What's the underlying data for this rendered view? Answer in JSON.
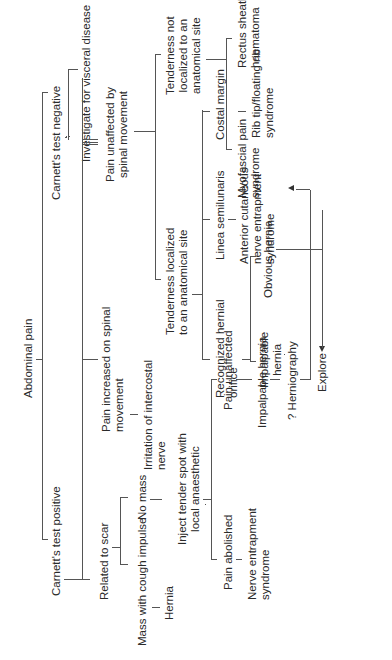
{
  "diagram": {
    "orientation": "rotated-90-counterclockwise",
    "root": "Abdominal pain",
    "nodes": {
      "abdominal_pain": "Abdominal pain",
      "carnett_positive": "Carnett's test positive",
      "carnett_negative": "Carnett's test negative",
      "investigate_visceral": "Investigate for visceral disease",
      "related_to_scar": "Related to scar",
      "mass_with_cough": "Mass with cough impulse",
      "no_mass": "No mass",
      "hernia": "Hernia",
      "inject_tender_1": "Inject tender spot with",
      "inject_tender_2": "local anaesthetic",
      "pain_abolished": "Pain abolished",
      "nerve_entrapment_1": "Nerve entrapment",
      "nerve_entrapment_2": "syndrome",
      "pain_unaffected": "Pain unaffected",
      "impalpable_hernia_main": "Impalpable hernia",
      "herniography": "? Herniography",
      "explore": "Explore",
      "pain_increased_1": "Pain increased on spinal",
      "pain_increased_2": "movement",
      "irritation_1": "Irritation of intercostal",
      "irritation_2": "nerve",
      "pain_unaffected_spinal_1": "Pain unaffected by",
      "pain_unaffected_spinal_2": "spinal movement",
      "tender_localized_1": "Tenderness localized",
      "tender_localized_2": "to an anatomical site",
      "tender_not_localized_1": "Tenderness not",
      "tender_not_localized_2": "localized to an",
      "tender_not_localized_3": "anatomical site",
      "recognized_orifice_1": "Recognized hernial",
      "recognized_orifice_2": "orifice",
      "impalpable_hernia_1": "Impalpable",
      "impalpable_hernia_2": "hernia",
      "obvious_hernia": "Obvious hernia",
      "linea_semilunaris": "Linea semilunaris",
      "anterior_cutaneous_1": "Anterior cutaneous",
      "anterior_cutaneous_2": "nerve entrapment",
      "anterior_cutaneous_3": "syndrome",
      "costal_margin": "Costal margin",
      "rib_tip_1": "Rib tip/floating rib",
      "rib_tip_2": "syndrome",
      "myofascial_1": "Myofascial pain",
      "myofascial_2": "syndrome",
      "rectus_sheath_1": "Rectus sheath",
      "rectus_sheath_2": "haematoma"
    },
    "edges": [
      [
        "Abdominal pain",
        "Carnett's test positive"
      ],
      [
        "Abdominal pain",
        "Carnett's test negative"
      ],
      [
        "Carnett's test negative",
        "Investigate for visceral disease"
      ],
      [
        "Carnett's test positive",
        "Related to scar"
      ],
      [
        "Carnett's test positive",
        "Pain increased on spinal movement"
      ],
      [
        "Carnett's test positive",
        "Pain unaffected by spinal movement"
      ],
      [
        "Related to scar",
        "Mass with cough impulse"
      ],
      [
        "Related to scar",
        "No mass"
      ],
      [
        "Mass with cough impulse",
        "Hernia"
      ],
      [
        "No mass",
        "Inject tender spot with local anaesthetic"
      ],
      [
        "Inject tender spot with local anaesthetic",
        "Pain abolished"
      ],
      [
        "Inject tender spot with local anaesthetic",
        "Pain unaffected"
      ],
      [
        "Pain abolished",
        "Nerve entrapment syndrome"
      ],
      [
        "Pain unaffected",
        "Impalpable hernia"
      ],
      [
        "Impalpable hernia",
        "? Herniography"
      ],
      [
        "? Herniography",
        "Explore"
      ],
      [
        "Pain increased on spinal movement",
        "Irritation of intercostal nerve"
      ],
      [
        "Pain unaffected by spinal movement",
        "Tenderness localized to an anatomical site"
      ],
      [
        "Pain unaffected by spinal movement",
        "Tenderness not localized to an anatomical site"
      ],
      [
        "Tenderness localized to an anatomical site",
        "Recognized hernial orifice"
      ],
      [
        "Tenderness localized to an anatomical site",
        "Linea semilunaris"
      ],
      [
        "Tenderness localized to an anatomical site",
        "Costal margin"
      ],
      [
        "Recognized hernial orifice",
        "Impalpable hernia"
      ],
      [
        "Recognized hernial orifice",
        "Obvious hernia"
      ],
      [
        "Impalpable hernia",
        "? Herniography"
      ],
      [
        "Obvious hernia",
        "Explore"
      ],
      [
        "Linea semilunaris",
        "Anterior cutaneous nerve entrapment syndrome"
      ],
      [
        "Costal margin",
        "Rib tip/floating rib syndrome"
      ],
      [
        "Tenderness not localized to an anatomical site",
        "Myofascial pain syndrome"
      ],
      [
        "Tenderness not localized to an anatomical site",
        "Rectus sheath haematoma"
      ]
    ]
  }
}
